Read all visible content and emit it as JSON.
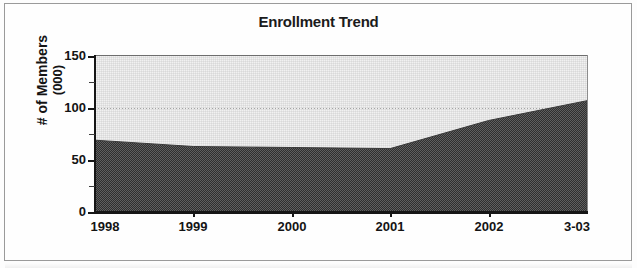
{
  "chart_data": {
    "type": "area",
    "title": "Enrollment Trend",
    "xlabel": "",
    "ylabel": "# of Members\n(000)",
    "ylabel_line1": "# of Members",
    "ylabel_line2": "(000)",
    "categories": [
      "1998",
      "1999",
      "2000",
      "2001",
      "2002",
      "3-03"
    ],
    "values": [
      69,
      63,
      62,
      61,
      88,
      107
    ],
    "series": [
      {
        "name": "# of Members (000)",
        "values": [
          69,
          63,
          62,
          61,
          88,
          107
        ]
      }
    ],
    "ylim": [
      0,
      150
    ],
    "ytick_labels": [
      "0",
      "50",
      "100",
      "150"
    ],
    "ytick_values": [
      0,
      50,
      100,
      150
    ],
    "yminor_tick_values": [
      25,
      75,
      125
    ],
    "grid": "horizontal-dotted",
    "legend": "none",
    "colors": {
      "area_fill": "#6b6b6b",
      "plot_background": "#f1f1f1",
      "axis": "#161616",
      "gridline": "#8d8d8d",
      "title_text": "#1b1b1b"
    }
  }
}
